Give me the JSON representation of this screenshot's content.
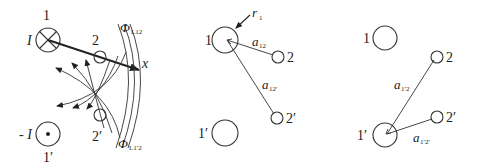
{
  "diagram": {
    "panels": [
      {
        "id": "left",
        "description": "Two-wire line (1, 1') with current I into page and -I out of page, flux linkages to conductors 2 and 2'",
        "conductors": [
          {
            "label": "1",
            "current_label": "I",
            "symbol": "cross"
          },
          {
            "label": "1′",
            "current_label": "- I",
            "symbol": "dot"
          },
          {
            "label": "2"
          },
          {
            "label": "2′"
          }
        ],
        "axis_label": "x",
        "flux_labels": {
          "phi_main": "Φ",
          "phi_upper_sub": "L12",
          "phi_lower_sub": "L1′2"
        }
      },
      {
        "id": "middle",
        "conductors": [
          {
            "label": "1"
          },
          {
            "label": "2"
          },
          {
            "label": "2′"
          },
          {
            "label": "1′"
          }
        ],
        "radius_label": "r",
        "radius_sub": "1",
        "distances": [
          {
            "main": "a",
            "sub": "12"
          },
          {
            "main": "a",
            "sub": "12′"
          }
        ]
      },
      {
        "id": "right",
        "conductors": [
          {
            "label": "1"
          },
          {
            "label": "2"
          },
          {
            "label": "2′"
          },
          {
            "label": "1′"
          }
        ],
        "distances": [
          {
            "main": "a",
            "sub": "1′2"
          },
          {
            "main": "a",
            "sub": "1′2′"
          }
        ]
      }
    ]
  }
}
